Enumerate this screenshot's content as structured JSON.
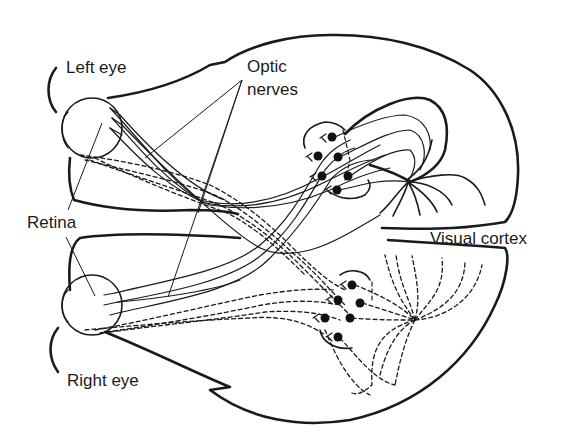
{
  "diagram": {
    "labels": {
      "left_eye": "Left eye",
      "right_eye": "Right eye",
      "optic_line1": "Optic",
      "optic_line2": "nerves",
      "retina": "Retina",
      "visual_cortex": "Visual cortex"
    },
    "structures": [
      "left-eye",
      "right-eye",
      "optic-nerves",
      "optic-chiasm",
      "lateral-geniculate-nucleus-upper",
      "lateral-geniculate-nucleus-lower",
      "visual-cortex-upper",
      "visual-cortex-lower",
      "brain-outline"
    ],
    "legend": {
      "solid_lines": "fibers from left-eye visual field side",
      "dashed_lines": "fibers from right-eye visual field side"
    },
    "colors": {
      "ink": "#1a1a1a",
      "background": "#ffffff"
    }
  }
}
